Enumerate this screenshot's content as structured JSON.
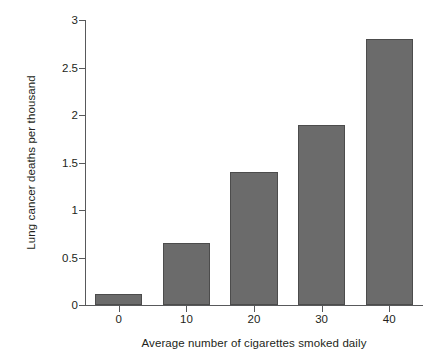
{
  "chart_data": {
    "type": "bar",
    "title": "",
    "subtitle": "",
    "xlabel": "Average number of cigarettes smoked daily",
    "ylabel": "Lung cancer deaths per thousand",
    "categories": [
      "0",
      "10",
      "20",
      "30",
      "40"
    ],
    "values": [
      0.12,
      0.65,
      1.4,
      1.9,
      2.8
    ],
    "series": [
      {
        "name": "Lung cancer deaths per thousand",
        "values": [
          0.12,
          0.65,
          1.4,
          1.9,
          2.8
        ]
      }
    ],
    "xtick_labels": [
      "0",
      "10",
      "20",
      "30",
      "40"
    ],
    "ytick_labels": [
      "0",
      "0.5",
      "1",
      "1.5",
      "2",
      "2.5",
      "3"
    ],
    "ytick_values": [
      0,
      0.5,
      1,
      1.5,
      2,
      2.5,
      3
    ],
    "ylim": [
      0,
      3
    ],
    "xlim": [
      -5,
      45
    ],
    "grid": false,
    "legend": false,
    "legend_position": "none",
    "bar_color": "#6b6b6b",
    "bar_edge_color": "#4c4c4c",
    "axis_color": "#58595b",
    "text_color": "#231f20",
    "background_color": "#ffffff",
    "annotations": []
  }
}
